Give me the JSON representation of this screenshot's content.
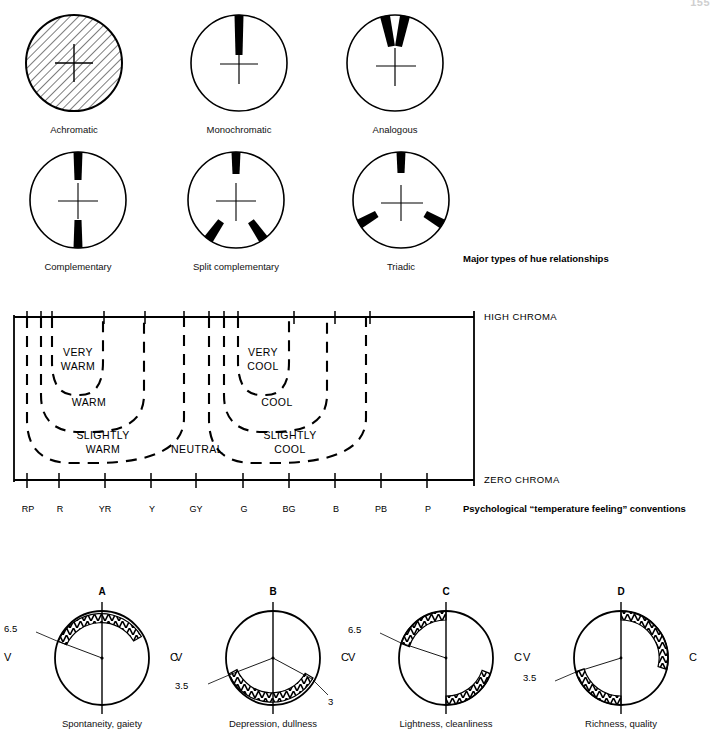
{
  "page": {
    "number": "155",
    "background": "#ffffff",
    "ink": "#000000"
  },
  "hue_relationships": {
    "caption": "Major types of hue relationships",
    "items": [
      {
        "id": "achromatic",
        "label": "Achromatic",
        "fill": "hatched",
        "marks": []
      },
      {
        "id": "monochromatic",
        "label": "Monochromatic",
        "fill": "none",
        "marks": [
          90
        ]
      },
      {
        "id": "analogous",
        "label": "Analogous",
        "fill": "none",
        "marks": [
          75,
          105
        ]
      },
      {
        "id": "complementary",
        "label": "Complementary",
        "fill": "none",
        "marks": [
          90,
          270
        ]
      },
      {
        "id": "split-complementary",
        "label": "Split complementary",
        "fill": "none",
        "marks": [
          90,
          250,
          290
        ]
      },
      {
        "id": "triadic",
        "label": "Triadic",
        "fill": "none",
        "marks": [
          90,
          210,
          330
        ]
      }
    ]
  },
  "temperature_chart": {
    "caption": "Psychological “temperature feeling” conventions",
    "top_axis_label": "HIGH  CHROMA",
    "bottom_axis_label": "ZERO  CHROMA",
    "hue_ticks": [
      "RP",
      "R",
      "YR",
      "Y",
      "GY",
      "G",
      "BG",
      "B",
      "PB",
      "P"
    ],
    "zones": [
      {
        "id": "very-warm",
        "label": "VERY\nWARM"
      },
      {
        "id": "warm",
        "label": "WARM"
      },
      {
        "id": "slightly-warm",
        "label": "SLIGHTLY\nWARM"
      },
      {
        "id": "neutral",
        "label": "NEUTRAL"
      },
      {
        "id": "slightly-cool",
        "label": "SLIGHTLY\nCOOL"
      },
      {
        "id": "cool",
        "label": "COOL"
      },
      {
        "id": "very-cool",
        "label": "VERY\nCOOL"
      }
    ],
    "zone_text": {
      "very_warm_1": "VERY",
      "very_warm_2": "WARM",
      "warm": "WARM",
      "slightly_warm_1": "SLIGHTLY",
      "slightly_warm_2": "WARM",
      "neutral": "NEUTRAL",
      "slightly_cool_1": "SLIGHTLY",
      "slightly_cool_2": "COOL",
      "cool": "COOL",
      "very_cool_1": "VERY",
      "very_cool_2": "COOL"
    }
  },
  "psychological": {
    "axis_left_label": "V",
    "axis_right_label": "C",
    "items": [
      {
        "id": "a",
        "title": "A",
        "caption": "Spontaneity, gaiety",
        "values": [
          "6.5"
        ],
        "value_positions": [
          "upper-left"
        ],
        "sectors": [
          {
            "start": 65,
            "end": 160,
            "hatched": true
          }
        ]
      },
      {
        "id": "b",
        "title": "B",
        "caption": "Depression, dullness",
        "values": [
          "3.5",
          "3"
        ],
        "value_positions": [
          "lower-left",
          "lower-right"
        ],
        "sectors": [
          {
            "start": 200,
            "end": 295,
            "hatched": true
          }
        ]
      },
      {
        "id": "c",
        "title": "C",
        "caption": "Lightness, cleanliness",
        "values": [
          "6.5"
        ],
        "value_positions": [
          "upper-left"
        ],
        "sectors": [
          {
            "start": 95,
            "end": 165,
            "hatched": true
          },
          {
            "start": 275,
            "end": 345,
            "hatched": true
          }
        ]
      },
      {
        "id": "d",
        "title": "D",
        "caption": "Richness, quality",
        "values": [
          "3.5"
        ],
        "value_positions": [
          "lower-left"
        ],
        "sectors": [
          {
            "start": 10,
            "end": 90,
            "hatched": true
          },
          {
            "start": 195,
            "end": 270,
            "hatched": true
          }
        ]
      }
    ]
  }
}
